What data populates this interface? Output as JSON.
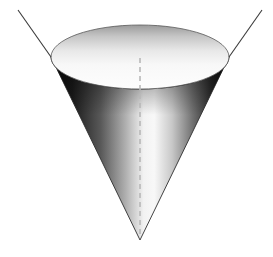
{
  "figure": {
    "orientation": "apex-down",
    "background_color": "#ffffff",
    "canvas": {
      "width": 273,
      "height": 257
    }
  },
  "geometry": {
    "apex": {
      "x": 140,
      "y": 240
    },
    "base_ellipse": {
      "center_x": 140,
      "center_y": 57,
      "radius_x": 89,
      "radius_y": 32,
      "top_y": 25,
      "bottom_y": 89,
      "left_x": 51,
      "right_x": 229
    },
    "axis": {
      "x": 140,
      "top_y": 58,
      "bottom_y": 236,
      "style": "dashed",
      "dash_pattern": "5 4"
    },
    "extension_lines": [
      {
        "name": "left-nappe-extension",
        "x1": 18,
        "y1": 10,
        "x2": 51,
        "y2": 57
      },
      {
        "name": "right-nappe-extension",
        "x1": 262,
        "y1": 10,
        "x2": 229,
        "y2": 57
      }
    ]
  },
  "colors": {
    "stroke": "#3a3a3a",
    "axis_dash": "#b8b8b8",
    "body_dark": "#0d0d0d",
    "body_mid": "#6b6b6b",
    "body_light": "#f7f7f7",
    "top_disk_dark": "#9a9a9a",
    "top_disk_light": "#fbfbfb",
    "rim_shadow": "#2a2a2a",
    "background": "#ffffff"
  },
  "shading": {
    "lateral_gradient_type": "linear-horizontal",
    "lateral_stops": [
      {
        "offset": "0%",
        "color": "#0a0a0a"
      },
      {
        "offset": "12%",
        "color": "#1c1c1c"
      },
      {
        "offset": "28%",
        "color": "#595959"
      },
      {
        "offset": "42%",
        "color": "#b0b0b0"
      },
      {
        "offset": "52%",
        "color": "#f2f2f2"
      },
      {
        "offset": "58%",
        "color": "#f8f8f8"
      },
      {
        "offset": "68%",
        "color": "#c8c8c8"
      },
      {
        "offset": "80%",
        "color": "#6e6e6e"
      },
      {
        "offset": "90%",
        "color": "#2b2b2b"
      },
      {
        "offset": "100%",
        "color": "#0a0a0a"
      }
    ],
    "top_disk_gradient_type": "linear-vertical",
    "top_disk_stops": [
      {
        "offset": "0%",
        "color": "#9b9b9b"
      },
      {
        "offset": "18%",
        "color": "#c6c6c6"
      },
      {
        "offset": "40%",
        "color": "#e8e8e8"
      },
      {
        "offset": "62%",
        "color": "#f8f8f8"
      },
      {
        "offset": "100%",
        "color": "#fdfdfd"
      }
    ]
  },
  "labels": {
    "axis_label": "",
    "apex_label": "",
    "base_label": "",
    "caption": ""
  }
}
